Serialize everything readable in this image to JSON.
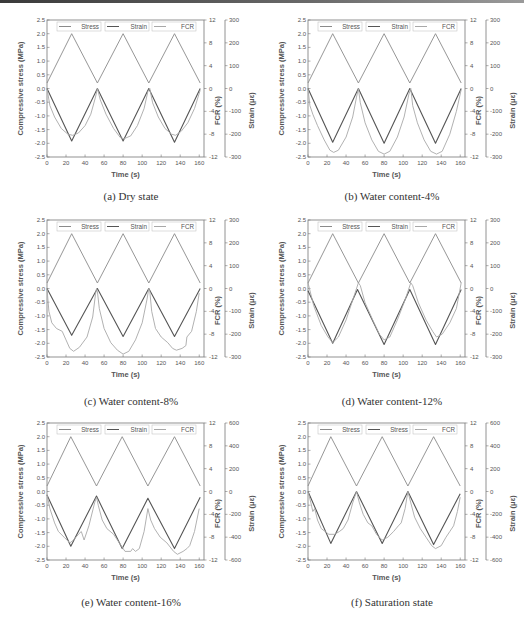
{
  "chart_data": [
    {
      "id": "a",
      "type": "line",
      "caption": "(a) Dry state",
      "xlabel": "Time (s)",
      "ylabel_left": "Compressive stress (MPa)",
      "ylabel_right1": "FCR (%)",
      "ylabel_right2": "Strain (με)",
      "xlim": [
        0,
        165
      ],
      "xticks": [
        0,
        20,
        40,
        60,
        80,
        100,
        120,
        140,
        160
      ],
      "ylim_left": [
        -2.5,
        2.5
      ],
      "yticks_left": [
        -2.5,
        -2.0,
        -1.5,
        -1.0,
        -0.5,
        0.0,
        0.5,
        1.0,
        1.5,
        2.0,
        2.5
      ],
      "ylim_fcr": [
        -12,
        12
      ],
      "yticks_fcr": [
        -12,
        -8,
        -4,
        0,
        4,
        8,
        12
      ],
      "ylim_strain": [
        -300,
        300
      ],
      "yticks_strain": [
        -300,
        -200,
        -100,
        0,
        100,
        200,
        300
      ],
      "legend": [
        "Stress",
        "Strain",
        "FCR"
      ],
      "series": [
        {
          "name": "Stress",
          "axis": "left",
          "x": [
            0,
            26,
            53,
            80,
            107,
            134,
            161
          ],
          "values": [
            0.2,
            2.0,
            0.2,
            2.0,
            0.2,
            2.0,
            0.2
          ]
        },
        {
          "name": "Strain",
          "axis": "strain",
          "x": [
            0,
            26,
            53,
            80,
            107,
            134,
            161
          ],
          "values": [
            0,
            -230,
            0,
            -230,
            0,
            -235,
            0
          ]
        },
        {
          "name": "FCR",
          "axis": "fcr",
          "x": [
            0,
            3,
            8,
            15,
            22,
            27,
            33,
            40,
            46,
            51,
            53,
            56,
            62,
            70,
            77,
            81,
            88,
            95,
            102,
            106,
            108,
            111,
            117,
            124,
            131,
            135,
            141,
            148,
            155,
            161
          ],
          "values": [
            0,
            -3,
            -5,
            -7,
            -8,
            -8.2,
            -7.8,
            -6.5,
            -4.5,
            -1.5,
            0,
            -2,
            -4.5,
            -7,
            -8.6,
            -8.8,
            -8.3,
            -6.5,
            -3.5,
            -0.5,
            0,
            -2.5,
            -5,
            -7,
            -8,
            -8.2,
            -7.5,
            -6,
            -3.5,
            -0.3
          ]
        }
      ]
    },
    {
      "id": "b",
      "type": "line",
      "caption": "(b) Water content-4%",
      "xlabel": "Time (s)",
      "ylabel_left": "Compressive stress (MPa)",
      "ylabel_right1": "FCR (%)",
      "ylabel_right2": "Strain (με)",
      "xlim": [
        0,
        165
      ],
      "xticks": [
        0,
        20,
        40,
        60,
        80,
        100,
        120,
        140,
        160
      ],
      "ylim_left": [
        -2.5,
        2.5
      ],
      "yticks_left": [
        -2.5,
        -2.0,
        -1.5,
        -1.0,
        -0.5,
        0.0,
        0.5,
        1.0,
        1.5,
        2.0,
        2.5
      ],
      "ylim_fcr": [
        -12,
        12
      ],
      "yticks_fcr": [
        -12,
        -8,
        -4,
        0,
        4,
        8,
        12
      ],
      "ylim_strain": [
        -300,
        300
      ],
      "yticks_strain": [
        -300,
        -200,
        -100,
        0,
        100,
        200,
        300
      ],
      "legend": [
        "Stress",
        "Strain",
        "FCR"
      ],
      "series": [
        {
          "name": "Stress",
          "axis": "left",
          "x": [
            0,
            26,
            53,
            80,
            107,
            134,
            161
          ],
          "values": [
            0.2,
            2.0,
            0.2,
            2.0,
            0.2,
            2.0,
            0.2
          ]
        },
        {
          "name": "Strain",
          "axis": "strain",
          "x": [
            0,
            26,
            53,
            80,
            107,
            134,
            161
          ],
          "values": [
            0,
            -235,
            0,
            -240,
            0,
            -240,
            0
          ]
        },
        {
          "name": "FCR",
          "axis": "fcr",
          "x": [
            0,
            2,
            5,
            10,
            17,
            23,
            27,
            32,
            40,
            47,
            51,
            53,
            55,
            60,
            67,
            74,
            80,
            86,
            94,
            101,
            106,
            108,
            110,
            115,
            122,
            129,
            135,
            141,
            149,
            156,
            161
          ],
          "values": [
            0,
            -3,
            -4.5,
            -6.5,
            -9,
            -10.8,
            -11.2,
            -10.8,
            -8.5,
            -5,
            -1.5,
            0,
            -2.5,
            -6,
            -9,
            -11,
            -11.5,
            -11,
            -8.5,
            -5,
            -1,
            0,
            -3,
            -6,
            -9,
            -11,
            -11.5,
            -11,
            -8,
            -4,
            -0.2
          ]
        }
      ]
    },
    {
      "id": "c",
      "type": "line",
      "caption": "(c) Water content-8%",
      "xlabel": "Time (s)",
      "ylabel_left": "Compressive stress (MPa)",
      "ylabel_right1": "FCR (%)",
      "ylabel_right2": "Strain (με)",
      "xlim": [
        0,
        165
      ],
      "xticks": [
        0,
        20,
        40,
        60,
        80,
        100,
        120,
        140,
        160
      ],
      "ylim_left": [
        -2.5,
        2.5
      ],
      "yticks_left": [
        -2.5,
        -2.0,
        -1.5,
        -1.0,
        -0.5,
        0.0,
        0.5,
        1.0,
        1.5,
        2.0,
        2.5
      ],
      "ylim_fcr": [
        -12,
        12
      ],
      "yticks_fcr": [
        -12,
        -8,
        -4,
        0,
        4,
        8,
        12
      ],
      "ylim_strain": [
        -300,
        300
      ],
      "yticks_strain": [
        -300,
        -200,
        -100,
        0,
        100,
        200,
        300
      ],
      "legend": [
        "Stress",
        "Strain",
        "FCR"
      ],
      "series": [
        {
          "name": "Stress",
          "axis": "left",
          "x": [
            0,
            26,
            53,
            80,
            107,
            134,
            161
          ],
          "values": [
            0.2,
            2.0,
            0.2,
            2.0,
            0.2,
            2.0,
            0.2
          ]
        },
        {
          "name": "Strain",
          "axis": "strain",
          "x": [
            0,
            26,
            53,
            80,
            107,
            134,
            161
          ],
          "values": [
            0,
            -205,
            0,
            -210,
            0,
            -210,
            0
          ]
        },
        {
          "name": "FCR",
          "axis": "fcr",
          "x": [
            0,
            2,
            5,
            10,
            16,
            20,
            24,
            28,
            34,
            42,
            48,
            51,
            52,
            53,
            55,
            60,
            67,
            74,
            80,
            86,
            93,
            100,
            105,
            107,
            108,
            110,
            114,
            120,
            127,
            132,
            136,
            142,
            146,
            147,
            152,
            157,
            160
          ],
          "values": [
            0,
            -4,
            -6,
            -7,
            -7.5,
            -9,
            -10.5,
            -11,
            -10.3,
            -8.5,
            -5,
            -1,
            0,
            -0.5,
            -3.5,
            -7,
            -9.5,
            -10.8,
            -11.5,
            -11,
            -9,
            -6,
            -2,
            0,
            -0.5,
            -4,
            -7,
            -8.5,
            -9.5,
            -10.5,
            -10.8,
            -10.5,
            -10,
            -8.5,
            -7.5,
            -4,
            -0.8
          ]
        }
      ]
    },
    {
      "id": "d",
      "type": "line",
      "caption": "(d) Water content-12%",
      "xlabel": "Time (s)",
      "ylabel_left": "Compressive stress (MPa)",
      "ylabel_right1": "FCR (%)",
      "ylabel_right2": "Strain (με)",
      "xlim": [
        0,
        165
      ],
      "xticks": [
        0,
        20,
        40,
        60,
        80,
        100,
        120,
        140,
        160
      ],
      "ylim_left": [
        -2.5,
        2.5
      ],
      "yticks_left": [
        -2.5,
        -2.0,
        -1.5,
        -1.0,
        -0.5,
        0.0,
        0.5,
        1.0,
        1.5,
        2.0,
        2.5
      ],
      "ylim_fcr": [
        -12,
        12
      ],
      "yticks_fcr": [
        -12,
        -8,
        -4,
        0,
        4,
        8,
        12
      ],
      "ylim_strain": [
        -300,
        300
      ],
      "yticks_strain": [
        -300,
        -200,
        -100,
        0,
        100,
        200,
        300
      ],
      "legend": [
        "Stress",
        "Strain",
        "FCR"
      ],
      "series": [
        {
          "name": "Stress",
          "axis": "left",
          "x": [
            0,
            26,
            53,
            80,
            107,
            134,
            161
          ],
          "values": [
            0.2,
            2.0,
            0.2,
            2.0,
            0.2,
            2.0,
            0.2
          ]
        },
        {
          "name": "Strain",
          "axis": "strain",
          "x": [
            0,
            26,
            52,
            80,
            107,
            134,
            161
          ],
          "values": [
            -10,
            -240,
            -5,
            -245,
            -5,
            -245,
            -5
          ]
        },
        {
          "name": "FCR",
          "axis": "fcr",
          "x": [
            0,
            6,
            14,
            21,
            26,
            32,
            40,
            48,
            53,
            55,
            60,
            68,
            75,
            80,
            86,
            94,
            102,
            108,
            110,
            116,
            124,
            131,
            135,
            141,
            149,
            156,
            161
          ],
          "values": [
            1,
            -3,
            -6.5,
            -8.5,
            -9.5,
            -8.5,
            -5.5,
            -1.5,
            1,
            0.5,
            -2.5,
            -5.5,
            -8,
            -9,
            -8.5,
            -5.5,
            -2,
            1,
            0.5,
            -2.5,
            -5.5,
            -7.5,
            -8.5,
            -8,
            -6,
            -3.5,
            1
          ]
        }
      ]
    },
    {
      "id": "e",
      "type": "line",
      "caption": "(e) Water content-16%",
      "xlabel": "Time (s)",
      "ylabel_left": "Compressive stress (MPa)",
      "ylabel_right1": "FCR (%)",
      "ylabel_right2": "Strain (με)",
      "xlim": [
        0,
        165
      ],
      "xticks": [
        0,
        20,
        40,
        60,
        80,
        100,
        120,
        140,
        160
      ],
      "ylim_left": [
        -2.5,
        2.5
      ],
      "yticks_left": [
        -2.5,
        -2.0,
        -1.5,
        -1.0,
        -0.5,
        0.0,
        0.5,
        1.0,
        1.5,
        2.0,
        2.5
      ],
      "ylim_fcr": [
        -12,
        12
      ],
      "yticks_fcr": [
        -12,
        -8,
        -4,
        0,
        4,
        8,
        12
      ],
      "ylim_strain": [
        -600,
        600
      ],
      "yticks_strain": [
        -600,
        -400,
        -200,
        0,
        200,
        400,
        600
      ],
      "legend": [
        "Stress",
        "Strain",
        "FCR"
      ],
      "series": [
        {
          "name": "Stress",
          "axis": "left",
          "x": [
            0,
            25,
            52,
            79,
            106,
            134,
            161
          ],
          "values": [
            0.2,
            2.0,
            0.2,
            2.0,
            0.2,
            2.0,
            0.2
          ]
        },
        {
          "name": "Strain",
          "axis": "strain",
          "x": [
            0,
            25,
            52,
            79,
            106,
            134,
            161
          ],
          "values": [
            -30,
            -480,
            -40,
            -500,
            -60,
            -500,
            -50
          ]
        },
        {
          "name": "FCR",
          "axis": "fcr",
          "x": [
            0,
            3,
            8,
            12,
            18,
            24,
            28,
            33,
            36,
            39,
            44,
            50,
            52,
            54,
            58,
            63,
            70,
            76,
            82,
            88,
            90,
            93,
            97,
            102,
            106,
            109,
            113,
            119,
            126,
            133,
            137,
            143,
            147,
            150,
            155,
            160
          ],
          "values": [
            -0.5,
            -3,
            -5.5,
            -7,
            -8,
            -9,
            -8.5,
            -7.5,
            -7,
            -8.5,
            -6,
            -2,
            -1,
            -2.5,
            -5,
            -6.5,
            -7.5,
            -9,
            -10.5,
            -10.5,
            -10,
            -10.5,
            -10,
            -7,
            -3,
            -5,
            -6.5,
            -8,
            -9,
            -10.5,
            -11,
            -10.5,
            -10,
            -9.5,
            -7,
            -3
          ]
        }
      ]
    },
    {
      "id": "f",
      "type": "line",
      "caption": "(f) Saturation state",
      "xlabel": "Time (s)",
      "ylabel_left": "Compressive stress (MPa)",
      "ylabel_right1": "FCR (%)",
      "ylabel_right2": "Strain (με)",
      "xlim": [
        0,
        165
      ],
      "xticks": [
        0,
        20,
        40,
        60,
        80,
        100,
        120,
        140,
        160
      ],
      "ylim_left": [
        -2.5,
        2.5
      ],
      "yticks_left": [
        -2.5,
        -2.0,
        -1.5,
        -1.0,
        -0.5,
        0.0,
        0.5,
        1.0,
        1.5,
        2.0,
        2.5
      ],
      "ylim_fcr": [
        -12,
        12
      ],
      "yticks_fcr": [
        -12,
        -8,
        -4,
        0,
        4,
        8,
        12
      ],
      "ylim_strain": [
        -600,
        600
      ],
      "yticks_strain": [
        -600,
        -400,
        -200,
        0,
        200,
        400,
        600
      ],
      "legend": [
        "Stress",
        "Stress",
        "FCR"
      ],
      "series": [
        {
          "name": "Stress",
          "axis": "left",
          "x": [
            0,
            24,
            51,
            78,
            105,
            132,
            160
          ],
          "values": [
            0.2,
            2.0,
            0.2,
            2.0,
            0.2,
            2.0,
            0.2
          ]
        },
        {
          "name": "Strain",
          "axis": "strain",
          "x": [
            0,
            24,
            51,
            78,
            105,
            132,
            160
          ],
          "values": [
            0,
            -455,
            0,
            -455,
            0,
            -465,
            -20
          ]
        },
        {
          "name": "FCR",
          "axis": "fcr",
          "x": [
            0,
            3,
            5,
            7,
            10,
            14,
            18,
            22,
            28,
            33,
            37,
            42,
            47,
            51,
            54,
            58,
            63,
            67,
            72,
            78,
            84,
            90,
            95,
            98,
            102,
            105,
            108,
            112,
            118,
            124,
            130,
            134,
            140,
            145,
            149,
            153,
            157,
            160
          ],
          "values": [
            0,
            -2,
            -3.5,
            -3,
            -5,
            -6.5,
            -7,
            -7.5,
            -7.5,
            -7,
            -6.5,
            -5,
            -2,
            0,
            -2,
            -4,
            -5.5,
            -6,
            -7.5,
            -8.5,
            -8,
            -7,
            -6,
            -5.5,
            -3,
            0,
            -2,
            -4.5,
            -6.5,
            -8,
            -9.5,
            -10,
            -9.5,
            -8,
            -7,
            -6,
            -3.5,
            -1
          ]
        }
      ]
    }
  ],
  "style": {
    "stress_color": "#8a8a8a",
    "strain_color": "#555555",
    "fcr_color": "#a8a8a8",
    "axis_color": "#777777",
    "label_color": "#555555"
  }
}
